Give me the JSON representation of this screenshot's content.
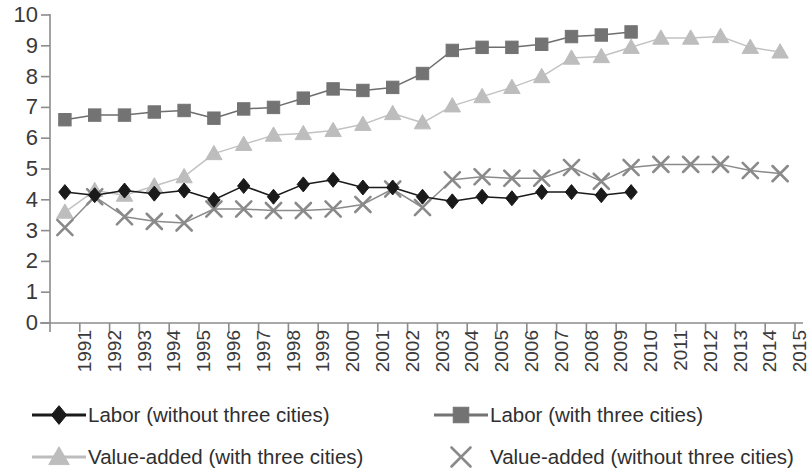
{
  "chart_data": {
    "type": "line",
    "title": "",
    "subtitle": "",
    "xlabel": "",
    "ylabel": "",
    "xlim_categories": [
      "1991",
      "2015"
    ],
    "ylim": [
      0,
      10
    ],
    "y_ticks": [
      0,
      1,
      2,
      3,
      4,
      5,
      6,
      7,
      8,
      9,
      10
    ],
    "grid": false,
    "legend_position": "bottom",
    "categories": [
      "1991",
      "1992",
      "1993",
      "1994",
      "1995",
      "1996",
      "1997",
      "1998",
      "1999",
      "2000",
      "2001",
      "2002",
      "2003",
      "2004",
      "2005",
      "2006",
      "2007",
      "2008",
      "2009",
      "2010",
      "2011",
      "2012",
      "2013",
      "2014",
      "2015"
    ],
    "series": [
      {
        "name": "Labor (without three cities)",
        "marker": "diamond",
        "color": "#1a1a1a",
        "line_color": "#1a1a1a",
        "values": [
          4.25,
          4.15,
          4.3,
          4.2,
          4.3,
          4.0,
          4.45,
          4.1,
          4.5,
          4.65,
          4.4,
          4.4,
          4.1,
          3.95,
          4.1,
          4.05,
          4.25,
          4.25,
          4.15,
          4.25,
          null,
          null,
          null,
          null,
          null
        ]
      },
      {
        "name": "Labor (with three cities)",
        "marker": "square",
        "color": "#737373",
        "line_color": "#6e6e6e",
        "values": [
          6.6,
          6.75,
          6.75,
          6.85,
          6.9,
          6.65,
          6.95,
          7.0,
          7.3,
          7.6,
          7.55,
          7.65,
          8.1,
          8.85,
          8.95,
          8.95,
          9.05,
          9.3,
          9.35,
          9.45,
          null,
          null,
          null,
          null,
          null
        ]
      },
      {
        "name": "Value-added (with three cities)",
        "marker": "triangle",
        "color": "#bdbdbd",
        "line_color": "#c2c2c2",
        "values": [
          3.6,
          4.3,
          4.15,
          4.45,
          4.75,
          5.5,
          5.8,
          6.1,
          6.15,
          6.25,
          6.45,
          6.8,
          6.5,
          7.05,
          7.35,
          7.65,
          8.0,
          8.6,
          8.65,
          8.95,
          9.25,
          9.25,
          9.3,
          8.95,
          8.8
        ]
      },
      {
        "name": "Value-added (without three cities)",
        "marker": "cross",
        "color": "#8a8a8a",
        "line_color": "#8a8a8a",
        "values": [
          3.1,
          4.1,
          3.45,
          3.3,
          3.25,
          3.7,
          3.7,
          3.65,
          3.65,
          3.7,
          3.85,
          4.35,
          3.75,
          4.65,
          4.75,
          4.7,
          4.7,
          5.05,
          4.6,
          5.05,
          5.15,
          5.15,
          5.15,
          4.95,
          4.85
        ]
      }
    ]
  },
  "axis": {
    "y_tick_labels": [
      "10",
      "9",
      "8",
      "7",
      "6",
      "5",
      "4",
      "3",
      "2",
      "1",
      "0"
    ],
    "x_tick_labels": [
      "1991",
      "1992",
      "1993",
      "1994",
      "1995",
      "1996",
      "1997",
      "1998",
      "1999",
      "2000",
      "2001",
      "2002",
      "2003",
      "2004",
      "2005",
      "2006",
      "2007",
      "2008",
      "2009",
      "2010",
      "2011",
      "2012",
      "2013",
      "2014",
      "2015"
    ],
    "axis_color": "#8c8c8c"
  },
  "legend": {
    "entries": [
      {
        "id": "labor-without",
        "label": "Labor (without three cities)",
        "marker": "diamond",
        "color": "#1a1a1a"
      },
      {
        "id": "labor-with",
        "label": "Labor (with three cities)",
        "marker": "square",
        "color": "#737373"
      },
      {
        "id": "va-with",
        "label": "Value-added (with three cities)",
        "marker": "triangle",
        "color": "#bdbdbd"
      },
      {
        "id": "va-without",
        "label": "Value-added (without three cities)",
        "marker": "cross",
        "color": "#8a8a8a"
      }
    ]
  }
}
